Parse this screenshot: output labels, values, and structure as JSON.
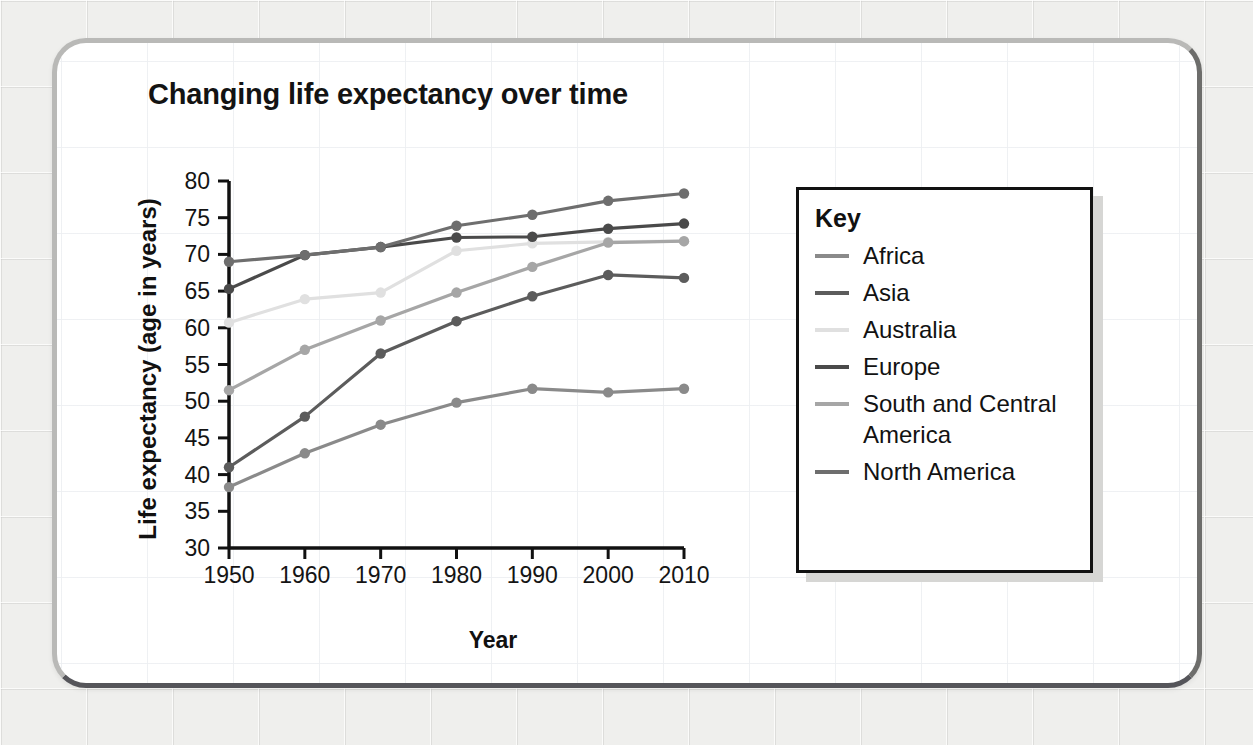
{
  "card": {
    "background_color": "#ffffff",
    "border_color": "#b9b9b7",
    "border_shadow_color": "#55555a"
  },
  "page": {
    "background_color": "#efefed"
  },
  "chart_data": {
    "type": "line",
    "title": "Changing life expectancy over time",
    "xlabel": "Year",
    "ylabel": "Life expectancy (age in years)",
    "x": [
      1950,
      1960,
      1970,
      1980,
      1990,
      2000,
      2010
    ],
    "xlim": [
      1950,
      2010
    ],
    "ylim": [
      30,
      80
    ],
    "yticks": [
      30,
      35,
      40,
      45,
      50,
      55,
      60,
      65,
      70,
      75,
      80
    ],
    "xticks": [
      "1950",
      "1960",
      "1970",
      "1980",
      "1990",
      "2000",
      "2010"
    ],
    "ytick_labels": [
      "80",
      "75",
      "70",
      "65",
      "60",
      "55",
      "50",
      "45",
      "40",
      "35",
      "30"
    ],
    "grid": false,
    "legend_position": "right",
    "legend_title": "Key",
    "markers": true,
    "series": [
      {
        "name": "Africa",
        "color": "#8a8a8a",
        "values": [
          38.3,
          42.9,
          46.8,
          49.8,
          51.7,
          51.2,
          51.7
        ]
      },
      {
        "name": "Asia",
        "color": "#5c5c5c",
        "values": [
          41.0,
          47.9,
          56.5,
          60.9,
          64.3,
          67.2,
          66.8
        ]
      },
      {
        "name": "Australia",
        "color": "#e0e0e0",
        "values": [
          60.7,
          63.9,
          64.8,
          70.5,
          71.5,
          71.7,
          71.8
        ]
      },
      {
        "name": "Europe",
        "color": "#4a4a4a",
        "values": [
          65.3,
          69.9,
          71.0,
          72.3,
          72.4,
          73.5,
          74.2
        ]
      },
      {
        "name": "South and Central America",
        "color": "#a6a6a6",
        "values": [
          51.5,
          57.0,
          61.0,
          64.8,
          68.3,
          71.6,
          71.8
        ]
      },
      {
        "name": "North America",
        "color": "#6e6e6e",
        "values": [
          69.0,
          69.9,
          71.0,
          73.9,
          75.4,
          77.3,
          78.3
        ]
      }
    ]
  }
}
